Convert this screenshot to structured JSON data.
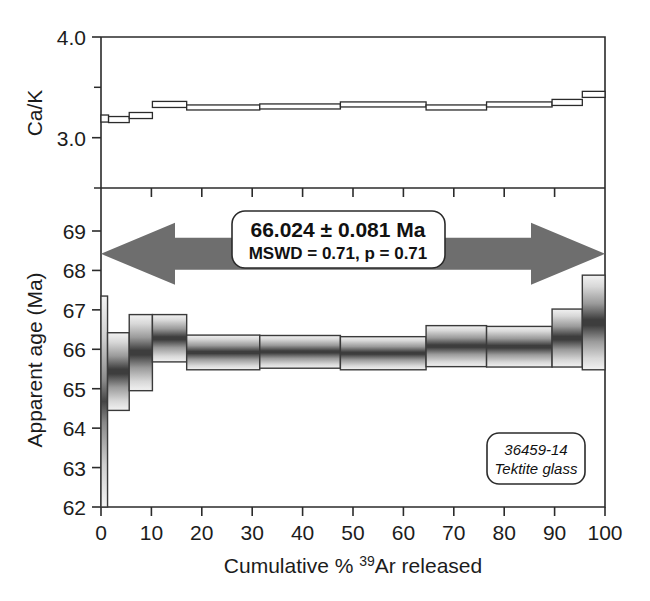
{
  "figure": {
    "title": "",
    "background_color": "#ffffff",
    "arrow_color": "#6e6e6e",
    "line_color": "#2b2b2b"
  },
  "annotations": {
    "plateau_age": "66.024 ± 0.081 Ma",
    "plateau_stats": "MSWD = 0.71, p = 0.71",
    "sample_id": "36459-14",
    "sample_material": "Tektite glass",
    "arrow_label": "plateau-extent-arrow"
  },
  "chart_data": [
    {
      "type": "bar",
      "name": "ca-k-panel",
      "title": "",
      "xlabel": "",
      "ylabel": "Ca/K",
      "xlim": [
        0,
        100
      ],
      "ylim": [
        2.5,
        4.0
      ],
      "grid": false,
      "legend": "none",
      "ytick_labels": [
        "4.0",
        "3.0"
      ],
      "ytick_values": [
        4.0,
        3.0
      ],
      "ytick_minor_values": [
        3.5,
        2.5
      ],
      "x_edges": [
        0,
        1.5,
        5.6,
        10.2,
        17.0,
        31.5,
        47.5,
        64.5,
        76.5,
        89.5,
        95.5,
        100
      ],
      "values": [
        3.19,
        3.18,
        3.22,
        3.33,
        3.3,
        3.31,
        3.33,
        3.3,
        3.33,
        3.35,
        3.43,
        3.45
      ],
      "err": [
        0.035,
        0.03,
        0.03,
        0.03,
        0.025,
        0.025,
        0.025,
        0.025,
        0.025,
        0.03,
        0.03,
        0.04
      ]
    },
    {
      "type": "bar",
      "name": "age-spectrum-panel",
      "title": "",
      "xlabel": "Cumulative % 39Ar released",
      "xlabel_parts": [
        "Cumulative % ",
        "39",
        "Ar released"
      ],
      "ylabel": "Apparent age (Ma)",
      "xlim": [
        0,
        100
      ],
      "ylim": [
        62.0,
        69.4
      ],
      "grid": false,
      "legend": "none",
      "xtick_labels": [
        "0",
        "10",
        "20",
        "30",
        "40",
        "50",
        "60",
        "70",
        "80",
        "90",
        "100"
      ],
      "xtick_values": [
        0,
        10,
        20,
        30,
        40,
        50,
        60,
        70,
        80,
        90,
        100
      ],
      "ytick_labels": [
        "69",
        "68",
        "67",
        "66",
        "65",
        "64",
        "63",
        "62"
      ],
      "ytick_values": [
        69,
        68,
        67,
        66,
        65,
        64,
        63,
        62
      ],
      "steps": [
        {
          "x0": 0.0,
          "x1": 1.3,
          "age": 64.7,
          "y_lo": 62.0,
          "y_hi": 67.35
        },
        {
          "x0": 1.3,
          "x1": 5.6,
          "age": 65.45,
          "y_lo": 64.45,
          "y_hi": 66.42
        },
        {
          "x0": 5.6,
          "x1": 10.2,
          "age": 65.9,
          "y_lo": 64.95,
          "y_hi": 66.88
        },
        {
          "x0": 10.2,
          "x1": 17.0,
          "age": 66.28,
          "y_lo": 65.68,
          "y_hi": 66.88
        },
        {
          "x0": 17.0,
          "x1": 31.5,
          "age": 65.92,
          "y_lo": 65.48,
          "y_hi": 66.36
        },
        {
          "x0": 31.5,
          "x1": 47.5,
          "age": 65.93,
          "y_lo": 65.52,
          "y_hi": 66.35
        },
        {
          "x0": 47.5,
          "x1": 64.5,
          "age": 65.9,
          "y_lo": 65.48,
          "y_hi": 66.32
        },
        {
          "x0": 64.5,
          "x1": 76.5,
          "age": 66.08,
          "y_lo": 65.56,
          "y_hi": 66.6
        },
        {
          "x0": 76.5,
          "x1": 89.5,
          "age": 66.06,
          "y_lo": 65.55,
          "y_hi": 66.58
        },
        {
          "x0": 89.5,
          "x1": 95.5,
          "age": 66.3,
          "y_lo": 65.55,
          "y_hi": 67.02
        },
        {
          "x0": 95.5,
          "x1": 100.0,
          "age": 66.65,
          "y_lo": 65.48,
          "y_hi": 67.88
        }
      ],
      "plateau_arrow": {
        "x0": 0,
        "x1": 100,
        "y": 68.42
      }
    }
  ]
}
